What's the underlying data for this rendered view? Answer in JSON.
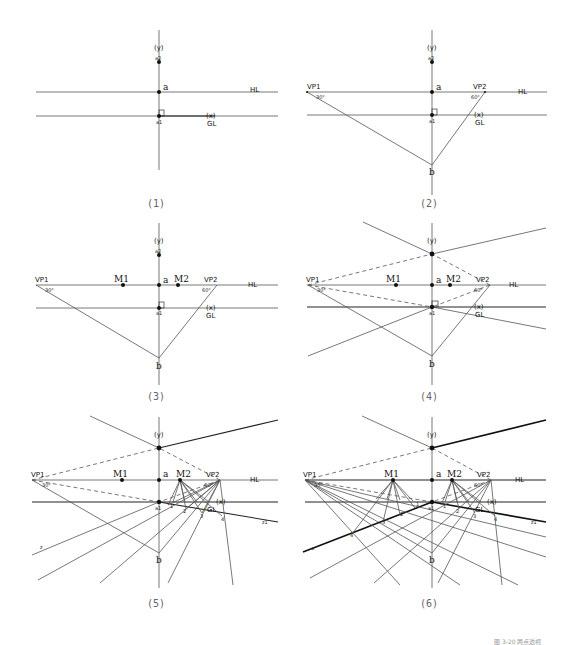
{
  "figure": {
    "panels": [
      {
        "id": 1,
        "caption": "(1)",
        "labels": {
          "y": "(y)",
          "top": "a2",
          "a": "a",
          "a1": "a1",
          "x": "(x)",
          "gl": "GL",
          "hl": "HL"
        }
      },
      {
        "id": 2,
        "caption": "(2)",
        "labels": {
          "y": "(y)",
          "top": "a2",
          "a": "a",
          "a1": "a1",
          "x": "(x)",
          "gl": "GL",
          "hl": "HL",
          "vp1": "VP1",
          "vp2": "VP2",
          "ang1": "30°",
          "ang2": "60°",
          "b": "b"
        }
      },
      {
        "id": 3,
        "caption": "(3)",
        "labels": {
          "y": "(y)",
          "top": "a2",
          "a": "a",
          "a1": "a1",
          "x": "(x)",
          "gl": "GL",
          "hl": "HL",
          "vp1": "VP1",
          "vp2": "VP2",
          "ang1": "30°",
          "ang2": "60°",
          "b": "b",
          "m1": "M1",
          "m2": "M2"
        }
      },
      {
        "id": 4,
        "caption": "(4)",
        "labels": {
          "y": "(y)",
          "top": "a2",
          "a": "a",
          "a1": "a1",
          "x": "(x)",
          "gl": "GL",
          "hl": "HL",
          "vp1": "VP1",
          "vp2": "VP2",
          "ang1": "30°",
          "ang2": "60°",
          "b": "b",
          "m1": "M1",
          "m2": "M2"
        }
      },
      {
        "id": 5,
        "caption": "(5)",
        "labels": {
          "y": "(y)",
          "top": "a2",
          "a": "a",
          "a1": "a1",
          "x": "(x)",
          "gl": "GL",
          "hl": "HL",
          "vp1": "VP1",
          "vp2": "VP2",
          "ang1": "30°",
          "ang2": "60°",
          "b": "b",
          "m1": "M1",
          "m2": "M2",
          "z": "z",
          "z1": "z1",
          "ticks": [
            "1",
            "2",
            "3",
            "4"
          ]
        }
      },
      {
        "id": 6,
        "caption": "(6)",
        "labels": {
          "y": "(y)",
          "top": "a2",
          "a": "a",
          "a1": "a1",
          "x": "(x)",
          "gl": "GL",
          "hl": "HL",
          "vp1": "VP1",
          "vp2": "VP2",
          "ang1": "30°",
          "ang2": "60°",
          "b": "b",
          "m1": "M1",
          "m2": "M2",
          "z": "z",
          "z1": "z1",
          "ticks": [
            "1",
            "2",
            "3",
            "4"
          ]
        }
      }
    ],
    "footer_note": "图 3-20 两点透视"
  }
}
